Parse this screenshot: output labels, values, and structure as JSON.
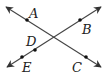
{
  "diagram": {
    "line_color": "#444444",
    "point_color": "#111111",
    "lines": [
      {
        "name": "line-AC",
        "from": [
          6,
          7
        ],
        "to": [
          101,
          67
        ],
        "points": [
          "A",
          "C"
        ]
      },
      {
        "name": "line-EB",
        "from": [
          7,
          67
        ],
        "to": [
          101,
          7
        ],
        "points": [
          "E",
          "D",
          "B"
        ]
      }
    ],
    "points": [
      {
        "id": "A",
        "label": "A",
        "x": 27,
        "y": 20,
        "lx": 29,
        "ly": 18
      },
      {
        "id": "B",
        "label": "B",
        "x": 80,
        "y": 20,
        "lx": 82,
        "ly": 34
      },
      {
        "id": "C",
        "label": "C",
        "x": 86,
        "y": 57,
        "lx": 72,
        "ly": 72
      },
      {
        "id": "D",
        "label": "D",
        "x": 35,
        "y": 50,
        "lx": 26,
        "ly": 46
      },
      {
        "id": "E",
        "label": "E",
        "x": 22,
        "y": 57,
        "lx": 22,
        "ly": 72
      }
    ]
  }
}
